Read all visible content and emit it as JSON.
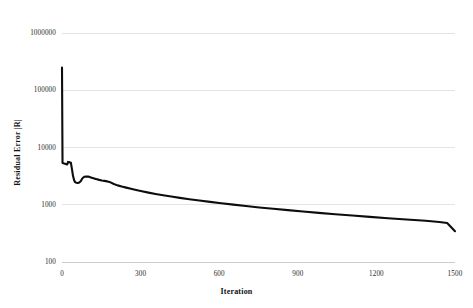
{
  "chart_data": {
    "type": "line",
    "title": "",
    "xlabel": "Iteration",
    "ylabel": "Residual Error |R|",
    "xlim": [
      0,
      1500
    ],
    "ylim": [
      100,
      1000000
    ],
    "yscale": "log",
    "xscale": "linear",
    "grid": true,
    "legend": false,
    "x_ticks": [
      "0",
      "300",
      "600",
      "900",
      "1200",
      "1500"
    ],
    "x_tick_values": [
      0,
      300,
      600,
      900,
      1200,
      1500
    ],
    "y_ticks": [
      "1000000",
      "100000",
      "10000",
      "1000",
      "100"
    ],
    "y_tick_values": [
      1000000,
      100000,
      10000,
      1000,
      100
    ],
    "series": [
      {
        "name": "Residual Error |R|",
        "color": "#0d0d0d",
        "x": [
          0,
          2,
          5,
          8,
          11,
          14,
          17,
          20,
          23,
          26,
          30,
          34,
          38,
          42,
          46,
          50,
          55,
          60,
          66,
          72,
          78,
          85,
          92,
          100,
          108,
          116,
          124,
          133,
          142,
          152,
          162,
          173,
          185,
          198,
          212,
          228,
          245,
          263,
          283,
          305,
          330,
          357,
          386,
          417,
          450,
          486,
          524,
          565,
          608,
          654,
          702,
          753,
          806,
          862,
          920,
          980,
          1043,
          1108,
          1175,
          1244,
          1315,
          1388,
          1440,
          1470,
          1500
        ],
        "y": [
          250000,
          5400,
          5300,
          5250,
          5200,
          5150,
          5100,
          5050,
          5600,
          5550,
          5500,
          5400,
          4200,
          3200,
          2700,
          2480,
          2420,
          2400,
          2450,
          2600,
          2900,
          3080,
          3120,
          3100,
          3020,
          2940,
          2860,
          2790,
          2720,
          2660,
          2610,
          2560,
          2460,
          2300,
          2180,
          2080,
          1990,
          1900,
          1810,
          1720,
          1630,
          1545,
          1465,
          1390,
          1318,
          1250,
          1185,
          1122,
          1062,
          1005,
          950,
          898,
          850,
          805,
          762,
          722,
          684,
          648,
          614,
          582,
          552,
          524,
          500,
          480,
          345
        ]
      }
    ]
  },
  "axes": {
    "x_title": "Iteration",
    "y_title": "Residual Error |R|"
  }
}
